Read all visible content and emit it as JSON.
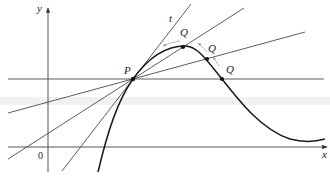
{
  "diagram": {
    "axes": {
      "x_label": "x",
      "y_label": "y",
      "origin_label": "0"
    },
    "point_p": {
      "label": "P"
    },
    "points_q": [
      {
        "label": "Q"
      },
      {
        "label": "Q"
      },
      {
        "label": "Q"
      }
    ],
    "tangent": {
      "label": "t"
    },
    "colors": {
      "curve": "#1a1a1a",
      "lines": "#333333",
      "motion_arrows": "#9a9a9a",
      "background_band": "#f1f1f1"
    }
  }
}
